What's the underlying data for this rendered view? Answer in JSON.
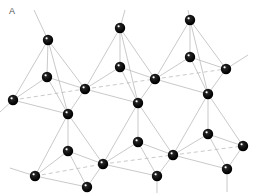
{
  "figure": {
    "label": "A",
    "colors": {
      "atom": "#000000",
      "bond": "#bbbbbb",
      "background": "#ffffff"
    }
  },
  "atoms": [
    [
      48,
      40
    ],
    [
      120,
      28
    ],
    [
      190,
      20
    ],
    [
      47,
      77
    ],
    [
      120,
      67
    ],
    [
      190,
      57
    ],
    [
      13,
      100
    ],
    [
      85,
      89
    ],
    [
      155,
      79
    ],
    [
      226,
      69
    ],
    [
      68,
      114
    ],
    [
      138,
      103
    ],
    [
      208,
      94
    ],
    [
      68,
      151
    ],
    [
      138,
      142
    ],
    [
      208,
      134
    ],
    [
      35,
      176
    ],
    [
      103,
      164
    ],
    [
      173,
      155
    ],
    [
      243,
      146
    ],
    [
      87,
      187
    ],
    [
      157,
      176
    ],
    [
      227,
      169
    ]
  ],
  "bonds": [
    [
      0,
      3
    ],
    [
      0,
      6
    ],
    [
      0,
      7
    ],
    [
      0,
      10
    ],
    [
      3,
      6
    ],
    [
      3,
      7
    ],
    [
      3,
      10
    ],
    [
      6,
      10
    ],
    [
      7,
      10
    ],
    [
      1,
      4
    ],
    [
      1,
      7
    ],
    [
      1,
      8
    ],
    [
      1,
      11
    ],
    [
      4,
      7
    ],
    [
      4,
      8
    ],
    [
      4,
      11
    ],
    [
      7,
      11
    ],
    [
      8,
      11
    ],
    [
      2,
      5
    ],
    [
      2,
      8
    ],
    [
      2,
      9
    ],
    [
      2,
      12
    ],
    [
      5,
      8
    ],
    [
      5,
      9
    ],
    [
      5,
      12
    ],
    [
      8,
      12
    ],
    [
      9,
      12
    ],
    [
      13,
      10
    ],
    [
      13,
      16
    ],
    [
      13,
      17
    ],
    [
      13,
      20
    ],
    [
      10,
      16
    ],
    [
      10,
      17
    ],
    [
      16,
      20
    ],
    [
      17,
      20
    ],
    [
      14,
      11
    ],
    [
      14,
      17
    ],
    [
      14,
      18
    ],
    [
      14,
      21
    ],
    [
      11,
      17
    ],
    [
      11,
      18
    ],
    [
      17,
      21
    ],
    [
      18,
      21
    ],
    [
      15,
      12
    ],
    [
      15,
      18
    ],
    [
      15,
      19
    ],
    [
      15,
      22
    ],
    [
      12,
      18
    ],
    [
      12,
      19
    ],
    [
      18,
      22
    ],
    [
      19,
      22
    ]
  ],
  "dashed": [
    [
      6,
      7
    ],
    [
      7,
      8
    ],
    [
      8,
      9
    ],
    [
      16,
      17
    ],
    [
      17,
      18
    ],
    [
      18,
      19
    ]
  ],
  "stubs": [
    [
      48,
      40,
      34,
      10
    ],
    [
      190,
      20,
      188,
      10
    ],
    [
      226,
      69,
      248,
      55
    ],
    [
      13,
      100,
      0,
      112
    ],
    [
      35,
      176,
      10,
      168
    ],
    [
      157,
      176,
      157,
      193
    ],
    [
      227,
      169,
      227,
      192
    ],
    [
      120,
      28,
      125,
      10
    ]
  ]
}
